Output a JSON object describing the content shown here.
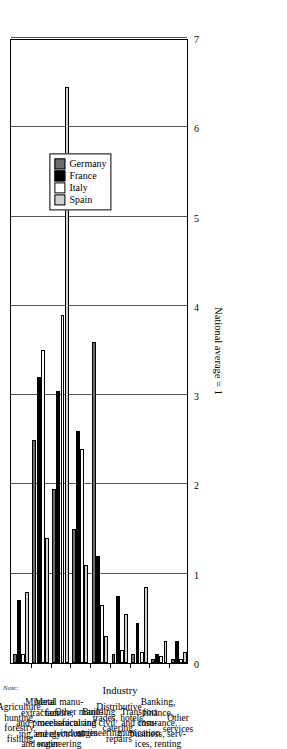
{
  "axis": {
    "value_axis_title": "National average = 1",
    "category_axis_title": "Industry",
    "ticks": [
      "0",
      "1",
      "2",
      "3",
      "4",
      "5",
      "6",
      "7"
    ],
    "value_min": 0,
    "value_max": 7
  },
  "legend": {
    "items": [
      {
        "label": "Germany",
        "color": "#6d6d6d",
        "swatch_name": "legend-swatch-germany"
      },
      {
        "label": "France",
        "color": "#000000",
        "swatch_name": "legend-swatch-france"
      },
      {
        "label": "Italy",
        "color": "#ffffff",
        "swatch_name": "legend-swatch-italy"
      },
      {
        "label": "Spain",
        "color": "#d0d0d0",
        "swatch_name": "legend-swatch-spain"
      }
    ]
  },
  "footnote": "Note:",
  "chart_data": {
    "type": "bar",
    "orientation": "horizontal",
    "title": "",
    "xlabel": "National average = 1",
    "ylabel": "Industry",
    "ylim": [
      0,
      7
    ],
    "grid": true,
    "legend_position": "upper-right",
    "categories": [
      "Agriculture, hunting, forestry, fishing",
      "Mineral extraction and process- ing, energy and water",
      "Metal manu- facture, mechanical and electrical engineering",
      "Other manu- facturing industries",
      "Building and civil engineering",
      "Distributive trades, hotels, catering, repairs",
      "Transport and com- munication",
      "Banking, finance, insurance, business, serv- ices, renting",
      "Other services"
    ],
    "categories_display": [
      "Agriculture,\nhunting,\nforestry,\nfishing",
      "Mineral\nextraction\nand process-\ning, energy\nand water",
      "Metal manu-\nfacture,\nmechanical\nand electrical\nengineering",
      "Other manu-\nfacturing\nindustries",
      "Building\nand civil\nengineering",
      "Distributive\ntrades, hotels,\ncatering,\nrepairs",
      "Transport\nand com-\nmunication",
      "Banking,\nfinance,\ninsurance,\nbusiness, serv-\nices, renting",
      "Other\nservices"
    ],
    "series": [
      {
        "name": "Germany",
        "color": "#6d6d6d",
        "values": [
          0.1,
          2.5,
          1.95,
          1.5,
          3.6,
          0.1,
          0.1,
          0.05,
          0.05
        ]
      },
      {
        "name": "France",
        "color": "#000000",
        "values": [
          0.7,
          3.2,
          3.05,
          2.6,
          1.2,
          0.75,
          0.45,
          0.1,
          0.25
        ]
      },
      {
        "name": "Italy",
        "color": "#ffffff",
        "values": [
          0.1,
          3.5,
          3.9,
          2.4,
          0.65,
          0.15,
          0.12,
          0.08,
          0.04
        ]
      },
      {
        "name": "Spain",
        "color": "#d0d0d0",
        "values": [
          0.8,
          1.4,
          6.45,
          1.1,
          0.3,
          0.55,
          0.85,
          0.25,
          0.12
        ]
      }
    ]
  }
}
